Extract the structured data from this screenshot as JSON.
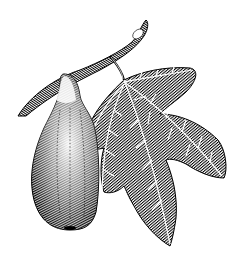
{
  "image": {
    "subject": "fig-branch-engraving",
    "style": "black-and-white botanical hatching engraving",
    "background": "#ffffff",
    "ink": "#000000"
  },
  "elements": {
    "branch": "diagonal twig from lower-left to upper-right",
    "fruit": "pear-shaped fig hanging from branch",
    "leaf": "five-lobed fig leaf with white veins on stem"
  }
}
